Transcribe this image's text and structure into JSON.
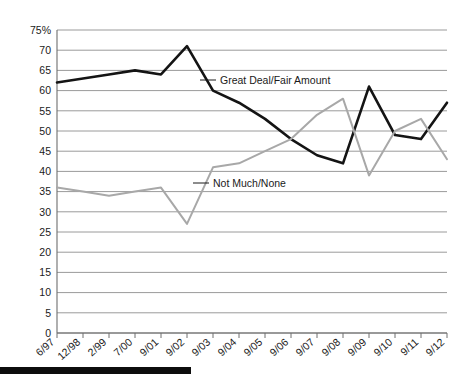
{
  "chart_data": {
    "type": "line",
    "title": "",
    "subtitle": "",
    "xlabel": "",
    "ylabel": "",
    "ylim": [
      0,
      75
    ],
    "ytick_labels": [
      "75%",
      "70",
      "65",
      "60",
      "55",
      "50",
      "45",
      "40",
      "35",
      "30",
      "25",
      "20",
      "15",
      "10",
      "5",
      "0"
    ],
    "ytick_values": [
      75,
      70,
      65,
      60,
      55,
      50,
      45,
      40,
      35,
      30,
      25,
      20,
      15,
      10,
      5,
      0
    ],
    "grid": true,
    "legend_position": "inline-annotation",
    "categories": [
      "6/97",
      "12/98",
      "2/99",
      "7/00",
      "9/01",
      "9/02",
      "9/03",
      "9/04",
      "9/05",
      "9/06",
      "9/07",
      "9/08",
      "9/09",
      "9/10",
      "9/11",
      "9/12"
    ],
    "series": [
      {
        "name": "Great Deal/Fair Amount",
        "color": "#141414",
        "values": [
          62,
          63,
          64,
          65,
          64,
          71,
          60,
          57,
          53,
          48,
          44,
          42,
          61,
          49,
          48,
          57
        ]
      },
      {
        "name": "Not Much/None",
        "color": "#a8a8a8",
        "values": [
          36,
          35,
          34,
          35,
          36,
          27,
          41,
          42,
          45,
          48,
          54,
          58,
          39,
          50,
          53,
          43
        ]
      }
    ],
    "annotations": [
      {
        "text": "Great Deal/Fair Amount",
        "series": "Great Deal/Fair Amount"
      },
      {
        "text": "Not Much/None",
        "series": "Not Much/None"
      }
    ]
  },
  "footer": {
    "rule": ""
  }
}
